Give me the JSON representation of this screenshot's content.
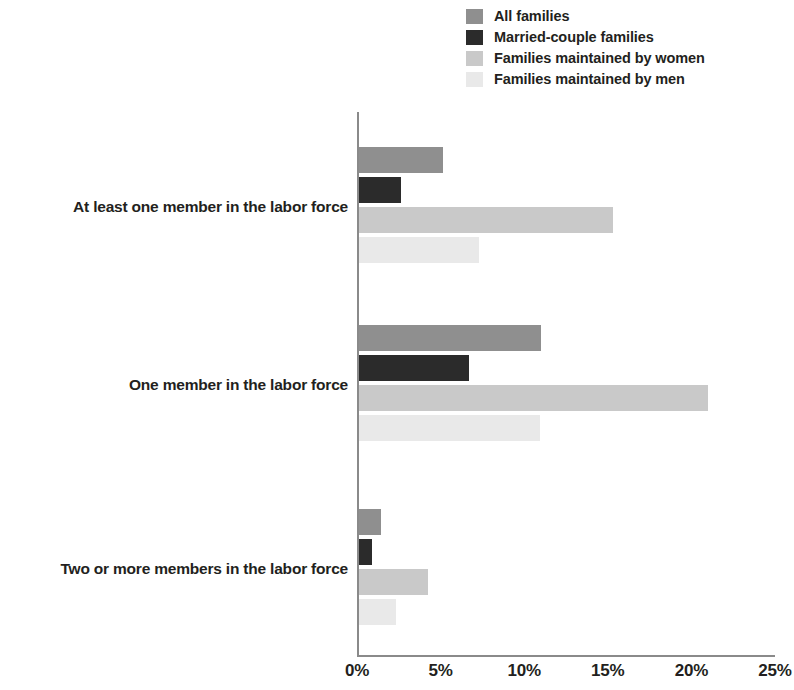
{
  "chart_data": {
    "type": "bar",
    "orientation": "horizontal",
    "title": "",
    "xlabel": "",
    "ylabel": "",
    "xlim": [
      0,
      25
    ],
    "xtick_labels": [
      "0%",
      "5%",
      "10%",
      "15%",
      "20%",
      "25%"
    ],
    "xtick_values": [
      0,
      5,
      10,
      15,
      20,
      25
    ],
    "grid": false,
    "legend_position": "top-right",
    "categories": [
      "At least one member in the labor force",
      "One member in the labor force",
      "Two or more members in the labor force"
    ],
    "series": [
      {
        "name": "All families",
        "color": "#8f8f8f",
        "values": [
          5.0,
          10.9,
          1.3
        ]
      },
      {
        "name": "Married-couple families",
        "color": "#2b2b2b",
        "values": [
          2.5,
          6.6,
          0.8
        ]
      },
      {
        "name": "Families maintained by women",
        "color": "#c9c9c9",
        "values": [
          15.2,
          20.9,
          4.1
        ]
      },
      {
        "name": "Families maintained by men",
        "color": "#e9e9e9",
        "values": [
          7.2,
          10.8,
          2.2
        ]
      }
    ]
  },
  "axis": {
    "line_color": "#8a8a8a"
  }
}
